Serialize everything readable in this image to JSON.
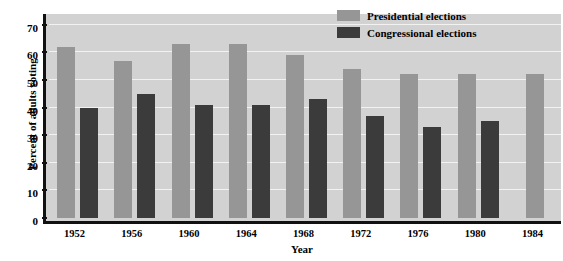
{
  "chart_data": {
    "type": "bar",
    "title": "",
    "xlabel": "Year",
    "ylabel": "Percent of adults voting",
    "categories": [
      "1952",
      "1956",
      "1960",
      "1964",
      "1968",
      "1972",
      "1976",
      "1980",
      "1984"
    ],
    "series": [
      {
        "name": "Presidential elections",
        "color": "#969696",
        "values": [
          62,
          57,
          63,
          63,
          59,
          54,
          52,
          52,
          52
        ]
      },
      {
        "name": "Congressional elections",
        "color": "#3b3b3b",
        "values": [
          40,
          45,
          41,
          41,
          43,
          37,
          33,
          35,
          null
        ]
      }
    ],
    "ylim": [
      0,
      75
    ],
    "yticks": [
      0,
      10,
      20,
      30,
      40,
      50,
      60,
      70
    ],
    "ytick_labels": [
      "0",
      "10",
      "20",
      "30",
      "40",
      "50",
      "60",
      "70"
    ],
    "grid": true,
    "legend_position": "top-right",
    "plot_background": "#d2d2d2",
    "gridline_color": "#f2f2f2",
    "axis_color": "#111111"
  },
  "legend": {
    "items": [
      {
        "label": "Presidential elections",
        "swatch": "#969696"
      },
      {
        "label": "Congressional elections",
        "swatch": "#3b3b3b"
      }
    ]
  },
  "axes": {
    "y_title": "Percent of adults voting",
    "x_title": "Year"
  }
}
